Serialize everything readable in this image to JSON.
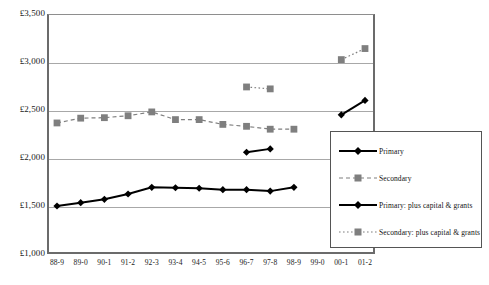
{
  "title_strip": "",
  "colors": {
    "primary_marker": "#000000",
    "secondary_marker": "#7f7f7f",
    "gridline": "#a8a8a8",
    "axis": "#6b6b6b",
    "background": "#ffffff",
    "legend_border": "#555555"
  },
  "axes": {
    "y_ticks": [
      "£1,000",
      "£1,500",
      "£2,000",
      "£2,500",
      "£3,000",
      "£3,500"
    ],
    "x_ticks": [
      "88-9",
      "89-0",
      "90-1",
      "91-2",
      "92-3",
      "93-4",
      "94-5",
      "95-6",
      "96-7",
      "97-8",
      "98-9",
      "99-0",
      "00-1",
      "01-2"
    ]
  },
  "legend": {
    "items": [
      {
        "label": "Primary",
        "key": "solid-black-diamond"
      },
      {
        "label": "Secondary",
        "key": "dashed-gray-square"
      },
      {
        "label": "Primary:  plus capital & grants",
        "key": "solid-black-diamond"
      },
      {
        "label": "Secondary: plus capital & grants",
        "key": "dotted-gray-square"
      }
    ]
  },
  "chart_data": {
    "type": "line",
    "title": "",
    "xlabel": "",
    "ylabel": "",
    "ylim": [
      1000,
      3500
    ],
    "ytick_step": 500,
    "grid": true,
    "legend_position": "inside-bottom-right",
    "currency": "GBP",
    "categories": [
      "88-9",
      "89-0",
      "90-1",
      "91-2",
      "92-3",
      "93-4",
      "94-5",
      "95-6",
      "96-7",
      "97-8",
      "98-9",
      "99-0",
      "00-1",
      "01-2"
    ],
    "series": [
      {
        "name": "Primary",
        "marker": "diamond",
        "color": "#000000",
        "line_style": "solid",
        "values": [
          1500,
          1535,
          1570,
          1625,
          1695,
          1690,
          1685,
          1670,
          1670,
          1655,
          1695,
          null,
          null,
          null
        ]
      },
      {
        "name": "Secondary",
        "marker": "square",
        "color": "#7f7f7f",
        "line_style": "dashed",
        "values": [
          2365,
          2415,
          2420,
          2440,
          2480,
          2400,
          2400,
          2350,
          2330,
          2300,
          2300,
          null,
          null,
          null
        ]
      },
      {
        "name": "Primary:  plus capital & grants",
        "marker": "diamond",
        "color": "#000000",
        "line_style": "solid",
        "values": [
          null,
          null,
          null,
          null,
          null,
          null,
          null,
          null,
          2060,
          2095,
          null,
          null,
          2450,
          2600
        ]
      },
      {
        "name": "Secondary: plus capital & grants",
        "marker": "square",
        "color": "#7f7f7f",
        "line_style": "dotted",
        "values": [
          null,
          null,
          null,
          null,
          null,
          null,
          null,
          null,
          2740,
          2720,
          null,
          null,
          3025,
          3140
        ]
      }
    ]
  }
}
